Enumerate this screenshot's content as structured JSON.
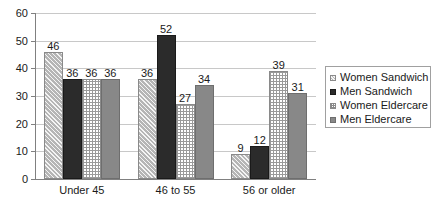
{
  "chart_data": {
    "type": "bar",
    "title": "",
    "subtitle": "",
    "xlabel": "",
    "ylabel": "",
    "categories": [
      "Under 45",
      "46 to 55",
      "56 or older"
    ],
    "series": [
      {
        "name": "Women Sandwich",
        "values": [
          46,
          36,
          9
        ],
        "pattern": "diagonal-hatch",
        "color": "#b5b5b5"
      },
      {
        "name": "Men Sandwich",
        "values": [
          36,
          52,
          12
        ],
        "pattern": "solid-dark",
        "color": "#2b2b2b"
      },
      {
        "name": "Women Eldercare",
        "values": [
          36,
          27,
          39
        ],
        "pattern": "cross-hatch",
        "color": "#ffffff"
      },
      {
        "name": "Men Eldercare",
        "values": [
          36,
          34,
          31
        ],
        "pattern": "solid-gray",
        "color": "#888888"
      }
    ],
    "ylim": [
      0,
      60
    ],
    "ytick_labels": [
      "0",
      "10",
      "20",
      "30",
      "40",
      "50",
      "60"
    ],
    "ytick_values": [
      0,
      10,
      20,
      30,
      40,
      50,
      60
    ],
    "grid": true,
    "grid_axis": "y",
    "legend_position": "right",
    "data_labels": true
  },
  "legend": {
    "items": [
      {
        "label": "Women Sandwich"
      },
      {
        "label": "Men Sandwich"
      },
      {
        "label": "Women Eldercare"
      },
      {
        "label": "Men Eldercare"
      }
    ]
  },
  "colors": {
    "gridline": "#c8c8c8",
    "axis": "#808080",
    "text": "#1a1a1a",
    "legend_border": "#a0a0a0",
    "background": "#ffffff"
  }
}
